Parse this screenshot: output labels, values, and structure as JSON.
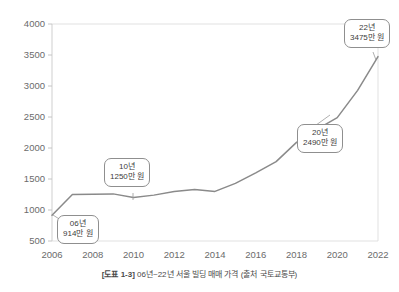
{
  "caption": {
    "tag": "[도표 1-3]",
    "text": " 06년~22년 서울 빌딩 매매 가격 (출처 국토교통부)"
  },
  "callouts": [
    {
      "name": "callout-2006",
      "year_label": "06년",
      "value_label": "914만 원"
    },
    {
      "name": "callout-2010",
      "year_label": "10년",
      "value_label": "1250만 원"
    },
    {
      "name": "callout-2020",
      "year_label": "20년",
      "value_label": "2490만 원"
    },
    {
      "name": "callout-2022",
      "year_label": "22년",
      "value_label": "3475만 원"
    }
  ],
  "chart_data": {
    "type": "line",
    "title": "",
    "xlabel": "",
    "ylabel": "",
    "xlim": [
      2006,
      2022
    ],
    "ylim": [
      500,
      4000
    ],
    "grid": false,
    "legend": "none",
    "x": [
      2006,
      2007,
      2008,
      2009,
      2010,
      2011,
      2012,
      2013,
      2014,
      2015,
      2016,
      2017,
      2018,
      2019,
      2020,
      2021,
      2022
    ],
    "values": [
      914,
      1250,
      1255,
      1260,
      1200,
      1240,
      1300,
      1330,
      1300,
      1430,
      1600,
      1780,
      2090,
      2300,
      2490,
      2930,
      3475
    ],
    "series": [
      {
        "name": "서울 빌딩 매매 가격",
        "unit": "만 원",
        "values": [
          914,
          1250,
          1255,
          1260,
          1200,
          1240,
          1300,
          1330,
          1300,
          1430,
          1600,
          1780,
          2090,
          2300,
          2490,
          2930,
          3475
        ]
      }
    ],
    "xticks": [
      "2006",
      "2008",
      "2010",
      "2012",
      "2014",
      "2016",
      "2018",
      "2020",
      "2022"
    ],
    "xtick_values": [
      2006,
      2008,
      2010,
      2012,
      2014,
      2016,
      2018,
      2020,
      2022
    ],
    "yticks": [
      "500",
      "1000",
      "1500",
      "2000",
      "2500",
      "3000",
      "3500",
      "4000"
    ],
    "ytick_values": [
      500,
      1000,
      1500,
      2000,
      2500,
      3000,
      3500,
      4000
    ],
    "annotations": [
      {
        "x": 2006,
        "y": 914,
        "label": "06년 914만 원"
      },
      {
        "x": 2010,
        "y": 1250,
        "label": "10년 1250만 원"
      },
      {
        "x": 2020,
        "y": 2490,
        "label": "20년 2490만 원"
      },
      {
        "x": 2022,
        "y": 3475,
        "label": "22년 3475만 원"
      }
    ],
    "colors": {
      "line": "#8a8a8a",
      "axis": "#c9c9c9",
      "tick_text": "#6b6b6b",
      "callout_border": "#8f8f8f",
      "background": "#ffffff"
    }
  }
}
